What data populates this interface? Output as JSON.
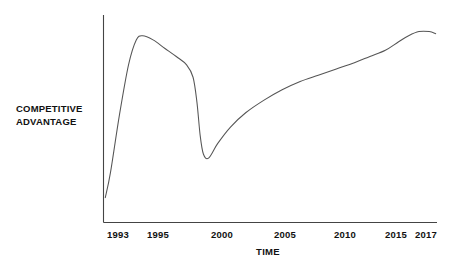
{
  "chart_data": {
    "type": "line",
    "title": "",
    "subtitle": "",
    "xlabel": "TIME",
    "ylabel": "COMPETITIVE ADVANTAGE",
    "ylabel_line1": "COMPETITIVE",
    "ylabel_line2": "ADVANTAGE",
    "grid": false,
    "legend": false,
    "legend_position": "none",
    "xtick_labels": [
      "1993",
      "1995",
      "2000",
      "2005",
      "2010",
      "2015",
      "2017"
    ],
    "xtick_values": [
      1993,
      1995,
      2000,
      2005,
      2010,
      2015,
      2017
    ],
    "xlim": [
      1992.4,
      2018.2
    ],
    "ylim": [
      0,
      100
    ],
    "ytick_labels": [],
    "line_color": "#555555",
    "axis_color": "#444444",
    "background_color": "#ffffff",
    "annotations": [],
    "series": [
      {
        "name": "Competitive Advantage",
        "x": [
          1992.5,
          1992.9,
          1993.6,
          1994.3,
          1994.9,
          1995.4,
          1996.2,
          1997.1,
          1998.0,
          1998.8,
          1999.3,
          1999.6,
          1999.85,
          2000.1,
          2000.5,
          2001.2,
          2002.2,
          2003.4,
          2004.8,
          2006.2,
          2007.6,
          2009.0,
          2010.4,
          2011.8,
          2013.0,
          2014.2,
          2015.2,
          2016.0,
          2016.8,
          2017.6,
          2018.1
        ],
        "y": [
          12,
          24,
          52,
          76,
          88,
          90,
          88,
          84,
          80,
          76,
          70,
          58,
          42,
          33,
          31,
          38,
          46,
          53,
          59,
          64,
          68,
          71,
          74,
          77,
          80,
          83,
          87,
          90,
          92,
          92,
          91
        ]
      }
    ]
  },
  "axis_label_x": "TIME",
  "axis_label_y_line1": "COMPETITIVE",
  "axis_label_y_line2": "ADVANTAGE",
  "ticks": {
    "t0": "1993",
    "t1": "1995",
    "t2": "2000",
    "t3": "2005",
    "t4": "2010",
    "t5": "2015",
    "t6": "2017"
  }
}
